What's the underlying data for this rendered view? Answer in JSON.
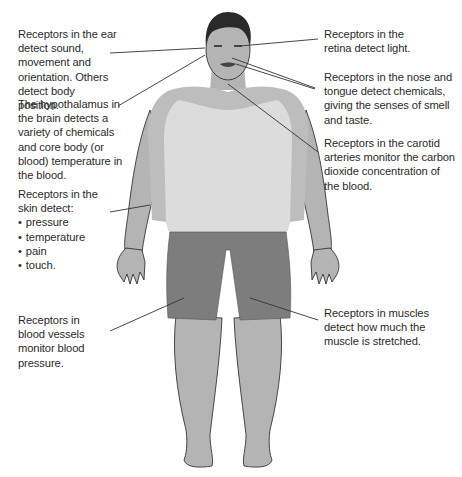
{
  "diagram": {
    "colors": {
      "skin": "#b4b4b4",
      "skin_dark": "#9a9a9a",
      "shirt": "#d9d9d9",
      "shorts": "#7f7f7f",
      "hair": "#2a2a2a",
      "outline": "#222222",
      "leader_line": "#333333",
      "text": "#2b2b2b"
    },
    "labels": {
      "ear": "Receptors in the ear detect sound, movement and orientation. Others detect body position.",
      "hypothalamus": "The hypothalamus in the brain detects a variety of chemicals and core body (or blood) temperature in the blood.",
      "skin_intro": "Receptors in the skin detect:",
      "skin_items": [
        "pressure",
        "temperature",
        "pain",
        "touch."
      ],
      "blood_vessels": "Receptors in blood vessels monitor blood pressure.",
      "retina": "Receptors in the retina detect light.",
      "nose_tongue": "Receptors in the nose and tongue detect chemicals, giving the senses of smell and taste.",
      "carotid": "Receptors in the carotid arteries monitor the carbon dioxide concentration of the blood.",
      "muscles": "Receptors in muscles detect how much the muscle is stretched."
    }
  }
}
